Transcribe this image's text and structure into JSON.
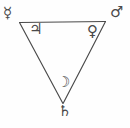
{
  "diagram": {
    "background_color": "#fefefe",
    "stroke_color": "#4a4a4a",
    "shape": {
      "name": "inverted-triangle",
      "vertices": [
        {
          "label": "top-left",
          "x": 20,
          "y": 22
        },
        {
          "label": "top-right",
          "x": 105,
          "y": 22
        },
        {
          "label": "bottom",
          "x": 63,
          "y": 103
        }
      ]
    },
    "symbols": [
      {
        "id": "mercury",
        "name": "Mercury",
        "glyph": "☿",
        "position": "outside-top-left-vertex"
      },
      {
        "id": "mars",
        "name": "Mars",
        "glyph": "♂",
        "position": "outside-top-right-vertex"
      },
      {
        "id": "jupiter",
        "name": "Jupiter",
        "glyph": "♃",
        "position": "inside-top-left"
      },
      {
        "id": "venus",
        "name": "Venus",
        "glyph": "♀",
        "position": "inside-top-right"
      },
      {
        "id": "moon",
        "name": "Moon",
        "glyph": "☽",
        "position": "inside-bottom"
      },
      {
        "id": "saturn",
        "name": "Saturn",
        "glyph": "♄",
        "position": "outside-bottom-vertex"
      }
    ]
  }
}
